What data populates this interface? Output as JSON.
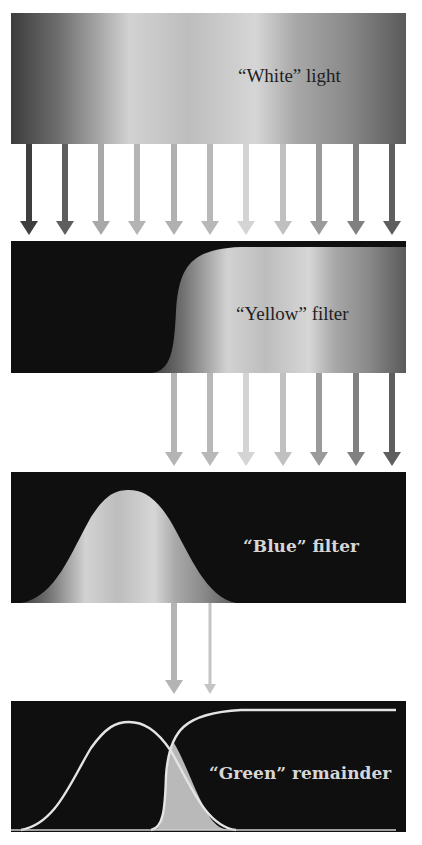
{
  "panels": [
    {
      "id": "white-light",
      "label": "“White” light"
    },
    {
      "id": "yellow-filter",
      "label": "“Yellow” filter"
    },
    {
      "id": "blue-filter",
      "label": "“Blue” filter"
    },
    {
      "id": "green-remainder",
      "label": "“Green” remainder"
    }
  ],
  "arrows": {
    "white_to_yellow": 11,
    "yellow_to_blue": 7,
    "blue_to_green": 2
  },
  "colors": {
    "panel_dark": "#0f0f0f",
    "spectrum_light": "#d8d8d8",
    "spectrum_mid": "#9a9a9a",
    "spectrum_dark": "#3a3a3a",
    "curve": "#e4e4e4",
    "overlap_fill": "#b9b9b9"
  }
}
